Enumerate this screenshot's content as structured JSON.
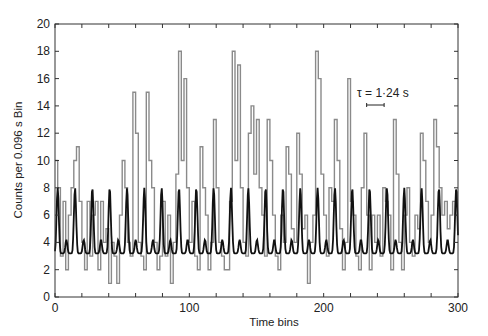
{
  "chart_data": {
    "type": "line",
    "title": "",
    "xlabel": "Time bins",
    "ylabel": "Counts per 0.096 s Bin",
    "xlim": [
      0,
      300
    ],
    "ylim": [
      0,
      20
    ],
    "xticks": [
      0,
      100,
      200,
      300
    ],
    "xminor_step": 20,
    "yticks": [
      0,
      2,
      4,
      6,
      8,
      10,
      12,
      14,
      16,
      18,
      20
    ],
    "grid": false,
    "annotation": {
      "text": "τ = 1·24 s",
      "x_bin": 235,
      "y": 13.8,
      "bar_from_bin": 232,
      "bar_to_bin": 245
    },
    "series": [
      {
        "name": "counts",
        "style": "step",
        "color": "#8a8a8a",
        "x": [
          0,
          2,
          4,
          6,
          8,
          10,
          12,
          14,
          16,
          18,
          20,
          22,
          24,
          26,
          28,
          30,
          32,
          34,
          36,
          38,
          40,
          42,
          44,
          46,
          48,
          50,
          52,
          54,
          56,
          58,
          60,
          62,
          64,
          66,
          68,
          70,
          72,
          74,
          76,
          78,
          80,
          82,
          84,
          86,
          88,
          90,
          92,
          94,
          96,
          98,
          100,
          102,
          104,
          106,
          108,
          110,
          112,
          114,
          116,
          118,
          120,
          122,
          124,
          126,
          128,
          130,
          132,
          134,
          136,
          138,
          140,
          142,
          144,
          146,
          148,
          150,
          152,
          154,
          156,
          158,
          160,
          162,
          164,
          166,
          168,
          170,
          172,
          174,
          176,
          178,
          180,
          182,
          184,
          186,
          188,
          190,
          192,
          194,
          196,
          198,
          200,
          202,
          204,
          206,
          208,
          210,
          212,
          214,
          216,
          218,
          220,
          222,
          224,
          226,
          228,
          230,
          232,
          234,
          236,
          238,
          240,
          242,
          244,
          246,
          248,
          250,
          252,
          254,
          256,
          258,
          260,
          262,
          264,
          266,
          268,
          270,
          272,
          274,
          276,
          278,
          280,
          282,
          284,
          286,
          288,
          290,
          292,
          294,
          296,
          298
        ],
        "values": [
          10,
          8,
          3,
          7,
          2,
          6,
          8,
          10,
          11,
          7,
          4,
          2,
          7,
          3,
          6,
          7,
          2,
          7,
          4,
          5,
          1,
          4,
          3,
          1,
          6,
          10,
          8,
          4,
          3,
          15,
          12,
          4,
          3,
          2,
          15,
          10,
          8,
          4,
          2,
          3,
          7,
          3,
          6,
          1,
          4,
          9,
          18,
          10,
          16,
          8,
          4,
          7,
          3,
          2,
          11,
          8,
          6,
          2,
          4,
          13,
          8,
          4,
          3,
          2,
          2,
          7,
          18,
          10,
          17,
          8,
          4,
          3,
          12,
          14,
          9,
          13,
          8,
          6,
          3,
          13,
          10,
          6,
          3,
          2,
          6,
          4,
          11,
          9,
          5,
          4,
          12,
          9,
          5,
          6,
          1,
          4,
          6,
          18,
          16,
          9,
          6,
          3,
          8,
          7,
          13,
          10,
          5,
          2,
          4,
          16,
          7,
          6,
          3,
          2,
          8,
          12,
          6,
          2,
          6,
          4,
          6,
          3,
          8,
          7,
          6,
          2,
          13,
          9,
          4,
          2,
          6,
          8,
          4,
          3,
          6,
          5,
          12,
          10,
          7,
          4,
          6,
          13,
          11,
          8,
          6,
          7,
          5,
          6,
          7,
          6
        ]
      },
      {
        "name": "smoothed fit",
        "style": "line",
        "color": "#111111",
        "period_bins": 12.9,
        "baseline": 3.2,
        "peak": 8.0,
        "secondary_peak": 4.2
      }
    ]
  }
}
